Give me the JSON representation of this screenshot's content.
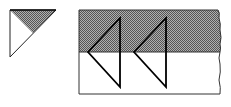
{
  "diagram": {
    "type": "geometric-illustration",
    "background": "#ffffff",
    "stroke_color": "#111111",
    "shade_color": "#7a7a7a",
    "shade_pattern": "checker-dither",
    "small_triangle": {
      "description": "Right triangle with shaded upper wedge",
      "points": [
        [
          10,
          10
        ],
        [
          56,
          10
        ],
        [
          10,
          57
        ]
      ],
      "shaded_points": [
        [
          10,
          10
        ],
        [
          56,
          10
        ],
        [
          33,
          33
        ]
      ]
    },
    "strip": {
      "description": "Rectangular strip with torn right edge, upper half shaded",
      "x": 79,
      "y": 10,
      "right": 220,
      "bottom": 94,
      "shade_bottom": 52
    },
    "arrows": [
      {
        "name": "left-triangle-1",
        "apex": [
          88,
          52
        ],
        "top": [
          120,
          18
        ],
        "bottom": [
          120,
          87
        ]
      },
      {
        "name": "left-triangle-2",
        "apex": [
          134,
          52
        ],
        "top": [
          166,
          18
        ],
        "bottom": [
          166,
          87
        ]
      }
    ]
  }
}
